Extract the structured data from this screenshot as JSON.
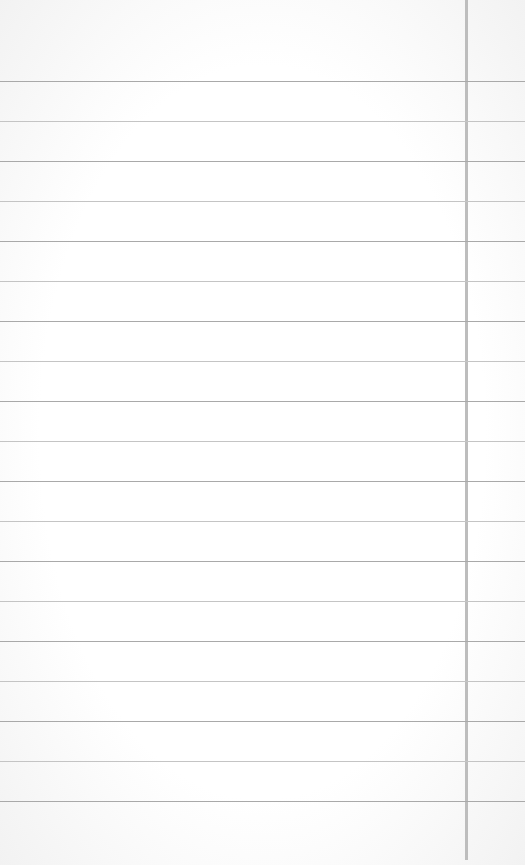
{
  "paper": {
    "type": "lined-paper",
    "background_color": "#ffffff",
    "line_color": "#a9a9a9",
    "margin_line_color": "#bdbdbd",
    "first_line_y": 81,
    "line_spacing": 40,
    "line_count": 19,
    "margin_line_x": 465
  }
}
